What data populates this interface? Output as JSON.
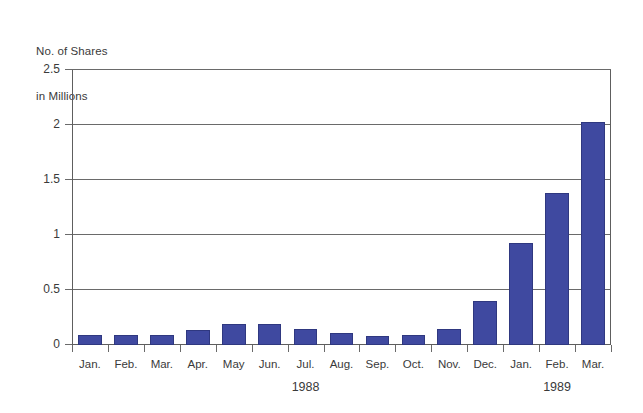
{
  "chart_data": {
    "type": "bar",
    "title": "",
    "ylabel_lines": [
      "No. of Shares",
      "in Millions"
    ],
    "xlabel": "",
    "ylabel": "No. of Shares in Millions",
    "ylim": [
      0,
      2.5
    ],
    "ytick_labels": [
      "0",
      "0.5",
      "1",
      "1.5",
      "2",
      "2.5"
    ],
    "ytick_values": [
      0,
      0.5,
      1,
      1.5,
      2,
      2.5
    ],
    "grid": true,
    "legend": "none",
    "bar_color": "#3f49a0",
    "categories": [
      "Jan.",
      "Feb.",
      "Mar.",
      "Apr.",
      "May",
      "Jun.",
      "Jul.",
      "Aug.",
      "Sep.",
      "Oct.",
      "Nov.",
      "Dec.",
      "Jan.",
      "Feb.",
      "Mar."
    ],
    "values": [
      0.09,
      0.09,
      0.09,
      0.14,
      0.19,
      0.19,
      0.15,
      0.11,
      0.08,
      0.09,
      0.15,
      0.4,
      0.93,
      1.38,
      2.03
    ],
    "group_labels": [
      {
        "text": "1988",
        "center_category_index": 6
      },
      {
        "text": "1989",
        "center_category_index": 13
      }
    ]
  }
}
